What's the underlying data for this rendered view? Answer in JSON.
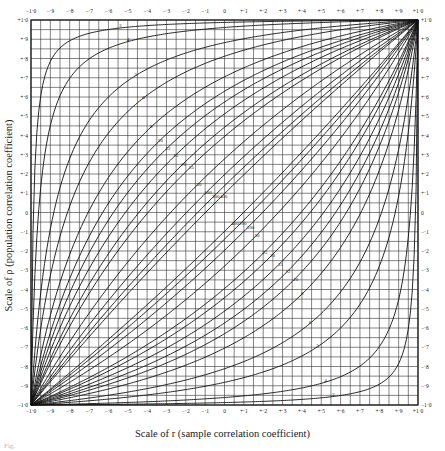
{
  "chart_data": {
    "type": "line",
    "xlabel": "Scale of r (sample correlation coefficient)",
    "ylabel": "Scale of ρ (population correlation coefficient)",
    "xlim": [
      -1.0,
      1.0
    ],
    "ylim": [
      -1.0,
      1.0
    ],
    "grid": true,
    "grid_step": 0.05,
    "x_ticks": [
      "−1·0",
      "−·9",
      "−·8",
      "−·7",
      "−·6",
      "−·5",
      "−·4",
      "−·3",
      "−·2",
      "−·1",
      "0",
      "+·1",
      "+·2",
      "+·3",
      "+·4",
      "+·5",
      "+·6",
      "+·7",
      "+·8",
      "+·9",
      "+1·0"
    ],
    "y_ticks": [
      "+1·0",
      "+·9",
      "+·8",
      "+·7",
      "+·6",
      "+·5",
      "+·4",
      "+·3",
      "+·2",
      "+·1",
      "0",
      "−·1",
      "−·2",
      "−·3",
      "−·4",
      "−·5",
      "−·6",
      "−·7",
      "−·8",
      "−·9",
      "−1·0"
    ],
    "series_sample_sizes": [
      3,
      4,
      5,
      6,
      8,
      10,
      12,
      15,
      20,
      25,
      50,
      100,
      200,
      400
    ],
    "series": [
      {
        "name": "n=3",
        "label": "3"
      },
      {
        "name": "n=4",
        "label": "4"
      },
      {
        "name": "n=5",
        "label": "5"
      },
      {
        "name": "n=6",
        "label": "6"
      },
      {
        "name": "n=8",
        "label": "8"
      },
      {
        "name": "n=10",
        "label": "10"
      },
      {
        "name": "n=12",
        "label": "12"
      },
      {
        "name": "n=15",
        "label": "15"
      },
      {
        "name": "n=20",
        "label": "20"
      },
      {
        "name": "n=25",
        "label": "25"
      },
      {
        "name": "n=50",
        "label": "50"
      },
      {
        "name": "n=100",
        "label": "100"
      },
      {
        "name": "n=200",
        "label": "200"
      },
      {
        "name": "n=400",
        "label": "400"
      }
    ],
    "belts": [
      "upper",
      "lower"
    ],
    "legend": "none (curves labelled inline by sample size)"
  },
  "caption": "Fig."
}
